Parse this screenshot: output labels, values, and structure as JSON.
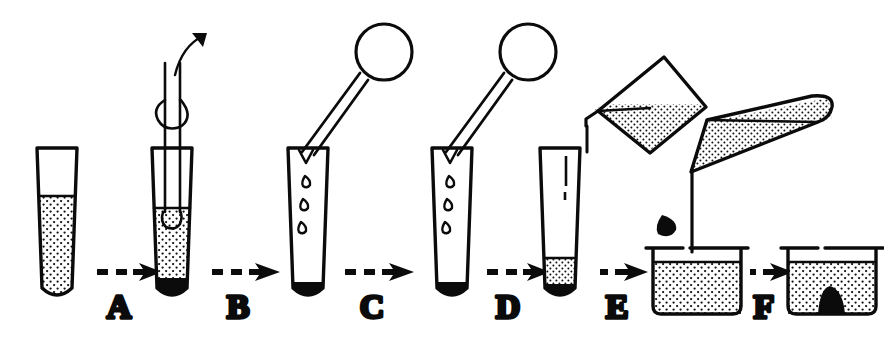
{
  "figure": {
    "style": "black-and-white line drawing with stipple shading",
    "background_color": "#ffffff",
    "ink_color": "#0b0b0b",
    "step_count": 6
  },
  "steps": [
    {
      "label": "A",
      "name": "aspirate-supernatant",
      "description": "Pasteur pipette inserted into centrifuged tube to draw off supernatant"
    },
    {
      "label": "B",
      "name": "remove-pipette",
      "description": "Pipette withdrawn, drops fall; pellet remains at tube tip"
    },
    {
      "label": "C",
      "name": "drain-residual",
      "description": "Tube with residual drops, pipette bulb held aside"
    },
    {
      "label": "D",
      "name": "add-buffer",
      "description": "Liquid poured from beaker into tube containing pellet"
    },
    {
      "label": "E",
      "name": "pour-into-beaker",
      "description": "Tube tipped horizontally, pellet dropped into beaker of liquid"
    },
    {
      "label": "F",
      "name": "pellet-in-beaker",
      "description": "Pellet settled at bottom of beaker"
    }
  ],
  "vessels": [
    {
      "name": "conical-tube-1",
      "contents": "stippled suspension",
      "pellet": false
    },
    {
      "name": "conical-tube-2",
      "contents": "stippled supernatant",
      "pellet": true
    },
    {
      "name": "conical-tube-3",
      "contents": "falling droplets",
      "pellet": true
    },
    {
      "name": "conical-tube-4",
      "contents": "falling droplets",
      "pellet": true
    },
    {
      "name": "conical-tube-5",
      "contents": "small stippled volume",
      "pellet": true
    },
    {
      "name": "beaker-1",
      "contents": "stippled liquid",
      "pellet": false
    },
    {
      "name": "beaker-2",
      "contents": "stippled liquid",
      "pellet": true
    }
  ],
  "instruments": [
    {
      "name": "pasteur-pipette-inserted",
      "detail": "double-line stem with bulge, curved aspiration arrow"
    },
    {
      "name": "pipette-bulb-1",
      "detail": "round rubber bulb on angled stem"
    },
    {
      "name": "pipette-bulb-2",
      "detail": "round rubber bulb on angled stem"
    },
    {
      "name": "pouring-beaker",
      "detail": "tilted beaker with stippled liquid and spout"
    },
    {
      "name": "horizontal-tube",
      "detail": "conical tube tipped nearly horizontal, thin stippled layer"
    }
  ],
  "labels": {
    "a": "A",
    "b": "B",
    "c": "C",
    "d": "D",
    "e": "E",
    "f": "F"
  }
}
